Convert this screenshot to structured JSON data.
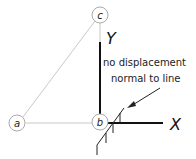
{
  "diagram": {
    "nodes": [
      {
        "id": "a",
        "label": "a"
      },
      {
        "id": "b",
        "label": "b"
      },
      {
        "id": "c",
        "label": "c"
      }
    ],
    "axes": {
      "y_label": "Y",
      "x_label": "X"
    },
    "annotation": {
      "line1": "no displacement",
      "line2": "normal to line"
    },
    "colors": {
      "member_line": "#c8c8c8",
      "axis_line": "#111111",
      "node_stroke": "#aaaaaa",
      "text": "#111111"
    }
  }
}
